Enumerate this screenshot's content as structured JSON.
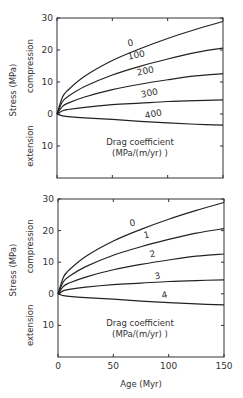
{
  "chart_data": [
    {
      "type": "line",
      "panel": "top",
      "title": "",
      "xlabel": "",
      "ylabel": "Stress (MPa)",
      "ylabel_regions": {
        "upper": "compression",
        "lower": "extension"
      },
      "xlim": [
        0,
        150
      ],
      "ylim": [
        -20,
        30
      ],
      "x_ticks": [
        0,
        50,
        100,
        150
      ],
      "x_tick_labels": [
        "",
        "",
        "",
        ""
      ],
      "y_ticks": [
        30,
        20,
        10,
        0,
        -10
      ],
      "y_tick_labels": [
        "30",
        "20",
        "10",
        "0",
        "10"
      ],
      "grid": false,
      "annotation": {
        "line1": "Drag coefficient",
        "line2": "(MPa/(m/yr) )"
      },
      "x": [
        0,
        5,
        10,
        25,
        50,
        75,
        100,
        125,
        150
      ],
      "series": [
        {
          "name": "0",
          "label": "0",
          "values": [
            0,
            5.3,
            7.5,
            11.8,
            16.7,
            20.4,
            23.6,
            26.4,
            28.9
          ]
        },
        {
          "name": "100",
          "label": "100",
          "values": [
            0,
            3.9,
            5.5,
            8.6,
            12.2,
            14.9,
            17.2,
            19.2,
            20.6
          ]
        },
        {
          "name": "200",
          "label": "200",
          "values": [
            0,
            2.4,
            3.4,
            5.3,
            7.6,
            9.3,
            10.7,
            11.9,
            12.6
          ]
        },
        {
          "name": "300",
          "label": "300",
          "values": [
            0,
            1.0,
            1.4,
            2.1,
            2.9,
            3.4,
            3.9,
            4.2,
            4.4
          ]
        },
        {
          "name": "400",
          "label": "400",
          "values": [
            0,
            -0.6,
            -0.8,
            -1.2,
            -1.7,
            -2.3,
            -2.8,
            -3.2,
            -3.5
          ]
        }
      ]
    },
    {
      "type": "line",
      "panel": "bottom",
      "title": "",
      "xlabel": "Age (Myr)",
      "ylabel": "Stress (MPa)",
      "ylabel_regions": {
        "upper": "compression",
        "lower": "extension"
      },
      "xlim": [
        0,
        150
      ],
      "ylim": [
        -20,
        30
      ],
      "x_ticks": [
        0,
        50,
        100,
        150
      ],
      "x_tick_labels": [
        "0",
        "50",
        "100",
        "150"
      ],
      "y_ticks": [
        30,
        20,
        10,
        0,
        -10
      ],
      "y_tick_labels": [
        "30",
        "20",
        "10",
        "0",
        "10"
      ],
      "grid": false,
      "annotation": {
        "line1": "Drag coefficient",
        "line2": "(MPa/(m/yr) )"
      },
      "x": [
        0,
        5,
        10,
        25,
        50,
        75,
        100,
        125,
        150
      ],
      "series": [
        {
          "name": "0",
          "label": "0",
          "values": [
            0,
            5.3,
            7.5,
            11.8,
            16.7,
            20.4,
            23.6,
            26.4,
            28.9
          ]
        },
        {
          "name": "1",
          "label": "1",
          "values": [
            0,
            3.9,
            5.5,
            8.6,
            12.2,
            14.9,
            17.2,
            19.2,
            20.6
          ]
        },
        {
          "name": "2",
          "label": "2",
          "values": [
            0,
            2.4,
            3.4,
            5.3,
            7.6,
            9.3,
            10.7,
            11.9,
            12.6
          ]
        },
        {
          "name": "3",
          "label": "3",
          "values": [
            0,
            1.0,
            1.4,
            2.1,
            2.9,
            3.4,
            3.9,
            4.2,
            4.4
          ]
        },
        {
          "name": "4",
          "label": "4",
          "values": [
            0,
            -0.6,
            -0.8,
            -1.2,
            -1.7,
            -2.3,
            -2.8,
            -3.2,
            -3.5
          ]
        }
      ]
    }
  ],
  "colors": {
    "line": "#222222",
    "axis": "#333333",
    "text": "#333333"
  }
}
